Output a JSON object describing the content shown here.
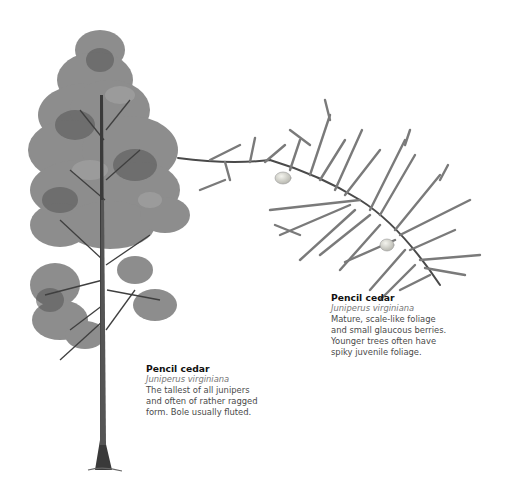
{
  "captions": {
    "tree": {
      "title": "Pencil cedar",
      "latin": "Juniperus virginiana",
      "lines": [
        "The tallest of all junipers",
        "and often of rather ragged",
        "form. Bole usually fluted."
      ]
    },
    "branch": {
      "title": "Pencil cedar",
      "latin": "Juniperus virginiana",
      "lines": [
        "Mature, scale-like foliage",
        "and small glaucous berries.",
        "Younger trees often have",
        "spiky juvenile foliage."
      ]
    }
  },
  "colors": {
    "background": "#ffffff",
    "foliage": "#6f6f6f",
    "foliage_dark": "#4a4a4a",
    "trunk": "#3a3a3a",
    "berry": "#d8d8d0"
  }
}
